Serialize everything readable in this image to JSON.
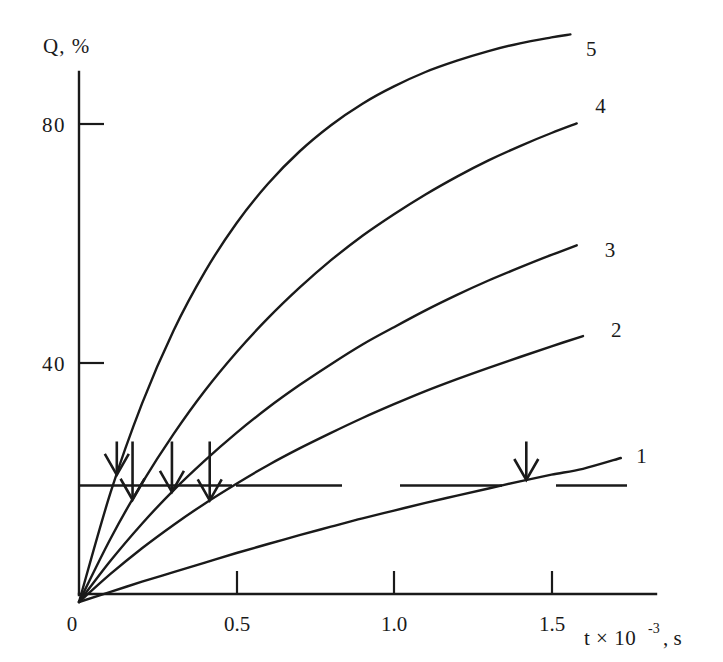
{
  "figure": {
    "title": "",
    "background_color": "#ffffff",
    "line_color": "#1a1a1a"
  },
  "axes": {
    "y_axis_label": "Q, %",
    "x_axis_label_main": "t × 10",
    "x_axis_label_exponent": "-3",
    "x_axis_label_tail": ", s",
    "origin_label": "0",
    "y_ticks": [
      "80",
      "40"
    ],
    "x_ticks": [
      "0.5",
      "1.0",
      "1.5"
    ]
  },
  "curve_labels": [
    "1",
    "2",
    "3",
    "4",
    "5"
  ],
  "annotations": {
    "arrow_count": 5,
    "threshold_label": ""
  },
  "chart_data": {
    "type": "line",
    "title": "",
    "subtitle": "",
    "xlabel": "t × 10⁻³, s",
    "ylabel": "Q, %",
    "xlim": [
      0,
      1.83
    ],
    "ylim": [
      0,
      94
    ],
    "x_tick_values": [
      0,
      0.5,
      1.0,
      1.5
    ],
    "x_tick_labels": [
      "0",
      "0.5",
      "1.0",
      "1.5"
    ],
    "y_tick_values": [
      40,
      80
    ],
    "y_tick_labels": [
      "40",
      "80"
    ],
    "grid": false,
    "legend": "inline curve end labels 1-5",
    "legend_position": "right of curve ends",
    "series": [
      {
        "name": "1",
        "label": "1",
        "label_x": 1.75,
        "label_y": 24.5,
        "x": [
          0,
          0.1,
          0.2,
          0.3,
          0.4,
          0.5,
          0.6,
          0.7,
          0.8,
          0.9,
          1.0,
          1.1,
          1.2,
          1.3,
          1.4,
          1.5,
          1.6,
          1.72
        ],
        "y": [
          0,
          1.7,
          3.4,
          5.0,
          6.6,
          8.2,
          9.7,
          11.2,
          12.6,
          14.0,
          15.3,
          16.6,
          17.8,
          19.0,
          20.2,
          21.3,
          22.3,
          24.1
        ]
      },
      {
        "name": "2",
        "label": "2",
        "label_x": 1.67,
        "label_y": 45.5,
        "x": [
          0,
          0.1,
          0.2,
          0.3,
          0.4,
          0.5,
          0.6,
          0.7,
          0.8,
          0.9,
          1.0,
          1.1,
          1.2,
          1.3,
          1.4,
          1.5,
          1.6
        ],
        "y": [
          0,
          4.7,
          9.0,
          12.9,
          16.5,
          19.8,
          22.9,
          25.7,
          28.3,
          30.8,
          33.1,
          35.3,
          37.3,
          39.2,
          41.0,
          42.8,
          44.5
        ]
      },
      {
        "name": "3",
        "label": "3",
        "label_x": 1.65,
        "label_y": 59.0,
        "x": [
          0,
          0.1,
          0.2,
          0.3,
          0.4,
          0.5,
          0.6,
          0.7,
          0.8,
          0.9,
          1.0,
          1.1,
          1.2,
          1.3,
          1.4,
          1.5,
          1.58
        ],
        "y": [
          0,
          6.9,
          13.1,
          18.7,
          23.7,
          28.3,
          32.5,
          36.3,
          39.8,
          43.1,
          46.0,
          48.8,
          51.4,
          53.8,
          56.0,
          58.1,
          59.7
        ]
      },
      {
        "name": "4",
        "label": "4",
        "label_x": 1.62,
        "label_y": 83.0,
        "x": [
          0,
          0.1,
          0.2,
          0.3,
          0.4,
          0.5,
          0.6,
          0.7,
          0.8,
          0.9,
          1.0,
          1.1,
          1.2,
          1.3,
          1.4,
          1.5,
          1.58
        ],
        "y": [
          0,
          10.6,
          19.9,
          28.1,
          35.4,
          41.8,
          47.5,
          52.6,
          57.2,
          61.3,
          64.9,
          68.2,
          71.2,
          73.9,
          76.3,
          78.5,
          80.1
        ]
      },
      {
        "name": "5",
        "label": "5",
        "label_x": 1.59,
        "label_y": 92.5,
        "x": [
          0,
          0.1,
          0.2,
          0.3,
          0.4,
          0.5,
          0.6,
          0.7,
          0.8,
          0.9,
          1.0,
          1.1,
          1.2,
          1.3,
          1.4,
          1.5,
          1.56
        ],
        "y": [
          0,
          18.3,
          33.2,
          45.4,
          55.3,
          63.4,
          70.0,
          75.4,
          79.8,
          83.4,
          86.3,
          88.7,
          90.6,
          92.2,
          93.5,
          94.5,
          95.0
        ]
      }
    ],
    "threshold_line": {
      "y": 19.5,
      "style": "dashed",
      "x_start": 0.0,
      "x_end": 1.83,
      "description": "horizontal reference level Q ≈ 20%"
    },
    "arrows": [
      {
        "x": 0.12,
        "y": 19.5,
        "direction": "down",
        "points_to_series": "5"
      },
      {
        "x": 0.17,
        "y": 19.5,
        "direction": "down",
        "points_to_series": "4"
      },
      {
        "x": 0.295,
        "y": 19.5,
        "direction": "down",
        "points_to_series": "3"
      },
      {
        "x": 0.415,
        "y": 19.5,
        "direction": "down",
        "points_to_series": "2"
      },
      {
        "x": 1.42,
        "y": 19.5,
        "direction": "down",
        "points_to_series": "1"
      }
    ]
  }
}
